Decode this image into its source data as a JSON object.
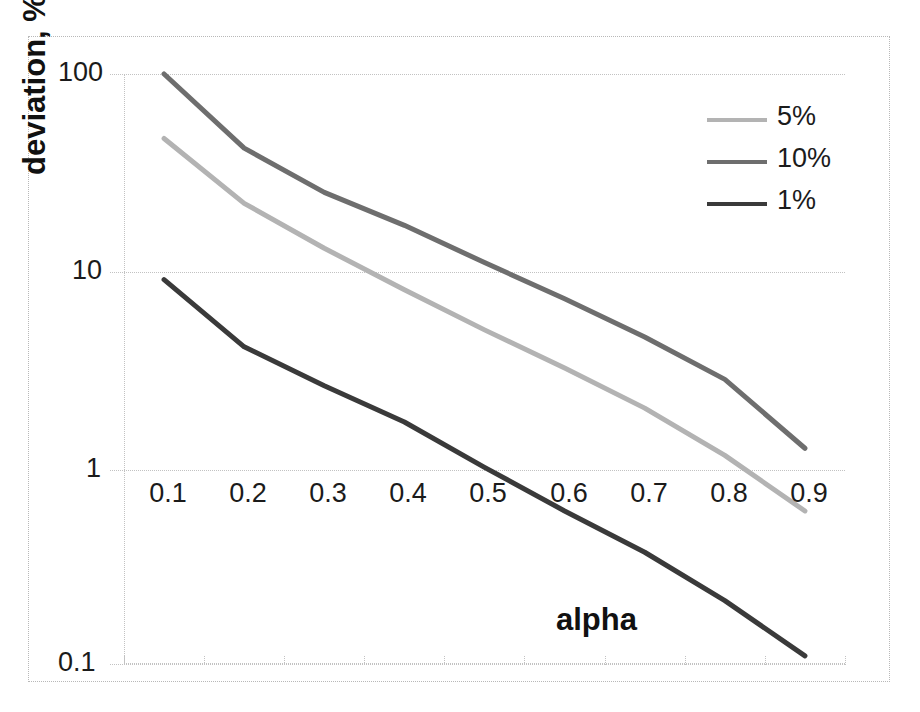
{
  "chart_data": {
    "type": "line",
    "title": "",
    "xlabel": "alpha",
    "ylabel": "deviation, %",
    "x": [
      0.1,
      0.2,
      0.3,
      0.4,
      0.5,
      0.6,
      0.7,
      0.8,
      0.9
    ],
    "xtick_labels": [
      "0.1",
      "0.2",
      "0.3",
      "0.4",
      "0.5",
      "0.6",
      "0.7",
      "0.8",
      "0.9"
    ],
    "yscale": "log",
    "ylim": [
      0.1,
      100
    ],
    "ytick_labels": [
      "100",
      "10",
      "1",
      "0.1"
    ],
    "ytick_values": [
      100,
      10,
      1,
      0.1
    ],
    "grid": true,
    "legend_position": "upper-right",
    "series": [
      {
        "name": "5%",
        "color": "#b3b3b3",
        "values": [
          47,
          22,
          13,
          8,
          5,
          3.2,
          2.0,
          1.15,
          0.6
        ]
      },
      {
        "name": "10%",
        "color": "#6e6e6e",
        "values": [
          100,
          42,
          25,
          17,
          11,
          7.2,
          4.6,
          2.8,
          1.25
        ]
      },
      {
        "name": "1%",
        "color": "#3a3a3a",
        "values": [
          9,
          4.1,
          2.6,
          1.7,
          1.0,
          0.6,
          0.37,
          0.21,
          0.11
        ]
      }
    ],
    "legend_order": [
      "5%",
      "10%",
      "1%"
    ]
  },
  "legend": {
    "items": [
      {
        "label": "5%"
      },
      {
        "label": "10%"
      },
      {
        "label": "1%"
      }
    ]
  },
  "axes": {
    "y_title": "deviation, %",
    "x_title": "alpha",
    "y_labels": [
      "100",
      "10",
      "1",
      "0.1"
    ],
    "x_labels": [
      "0.1",
      "0.2",
      "0.3",
      "0.4",
      "0.5",
      "0.6",
      "0.7",
      "0.8",
      "0.9"
    ]
  },
  "colors": {
    "series_5": "#b3b3b3",
    "series_10": "#6e6e6e",
    "series_1": "#3a3a3a",
    "gridline": "#c2c2c2",
    "border": "#b8b8b8",
    "text": "#1b1b1b"
  }
}
